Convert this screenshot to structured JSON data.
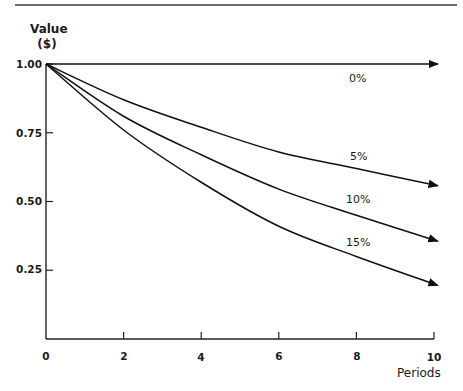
{
  "chart_data": {
    "type": "line",
    "title": "",
    "xlabel": "Periods",
    "ylabel_lines": [
      "Value",
      "($)"
    ],
    "ylabel": "Value ($)",
    "x": [
      0,
      2,
      4,
      6,
      8,
      10
    ],
    "xticks": [
      "0",
      "2",
      "4",
      "6",
      "8",
      "10"
    ],
    "yticks": [
      "1.00",
      "0.75",
      "0.50",
      "0.25"
    ],
    "xlim": [
      0,
      10
    ],
    "ylim": [
      0,
      1.0
    ],
    "grid": false,
    "legend": "inline labels near curve ends",
    "series": [
      {
        "name": "0%",
        "values": [
          1.0,
          1.0,
          1.0,
          1.0,
          1.0,
          1.0
        ]
      },
      {
        "name": "5%",
        "values": [
          1.0,
          0.87,
          0.77,
          0.68,
          0.62,
          0.56
        ]
      },
      {
        "name": "10%",
        "values": [
          1.0,
          0.81,
          0.67,
          0.545,
          0.45,
          0.36
        ]
      },
      {
        "name": "15%",
        "values": [
          1.0,
          0.76,
          0.57,
          0.41,
          0.3,
          0.2
        ]
      }
    ]
  },
  "colors": {
    "line": "#111111",
    "rule": "#6b6b6b",
    "background": "#ffffff"
  }
}
